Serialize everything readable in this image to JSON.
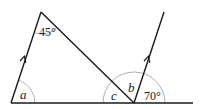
{
  "diagram": {
    "type": "geometry-angles",
    "labels": {
      "apex_angle": "45°",
      "angle_a": "a",
      "angle_b": "b",
      "angle_c": "c",
      "right_angle": "70°"
    },
    "colors": {
      "line": "#1a1a1a",
      "arc": "#9a9a9a",
      "text": "#222222"
    }
  }
}
